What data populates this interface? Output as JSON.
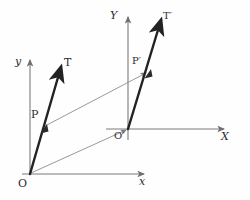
{
  "figure": {
    "background_color": "#fefefe",
    "ink_color": "#2b2b2b",
    "thin_line_color": "#8a8a8a",
    "axis_color": "#6f6f6f"
  },
  "labels": {
    "origin_o": "O",
    "axis_x_lower": "x",
    "axis_y_lower": "y",
    "point_p": "P",
    "point_t": "T",
    "origin_o_prime": "O′",
    "axis_x_upper": "X",
    "axis_y_upper": "Y",
    "point_p_prime": "P′",
    "point_t_prime": "T′"
  },
  "geometry": {
    "frame_lower": {
      "origin": [
        30,
        174
      ],
      "x_axis_end": [
        148,
        174
      ],
      "y_axis_top": [
        30,
        57
      ]
    },
    "frame_upper": {
      "origin": [
        128,
        129
      ],
      "x_axis_start": [
        108,
        129
      ],
      "x_axis_end": [
        228,
        129
      ],
      "y_axis_top": [
        128,
        14
      ]
    },
    "vector_ot": {
      "from": [
        30,
        174
      ],
      "to": [
        63,
        63
      ]
    },
    "vector_otp": {
      "from": [
        128,
        129
      ],
      "to": [
        163,
        15
      ]
    },
    "connector_oo_prime": {
      "from": [
        30,
        174
      ],
      "to": [
        128,
        129
      ]
    },
    "connector_pp_prime": {
      "from": [
        44,
        127
      ],
      "to": [
        148,
        72
      ]
    },
    "point_p": [
      44,
      127
    ],
    "point_p_prime": [
      148,
      72
    ]
  },
  "label_positions": {
    "origin_o": [
      18,
      179
    ],
    "axis_x_lower": [
      140,
      177
    ],
    "axis_y_lower": [
      15,
      57
    ],
    "point_p": [
      32,
      110
    ],
    "point_t": [
      64,
      59
    ],
    "origin_o_prime": [
      115,
      131
    ],
    "axis_x_upper": [
      222,
      131
    ],
    "axis_y_upper": [
      111,
      11
    ],
    "point_p_prime": [
      133,
      57
    ],
    "point_t_prime": [
      164,
      12
    ]
  }
}
